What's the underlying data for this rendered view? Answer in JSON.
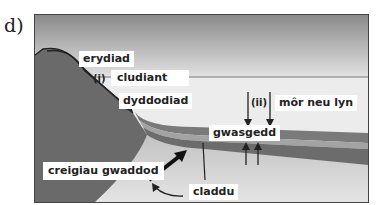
{
  "figure": {
    "part_label": "d)"
  },
  "labels": {
    "erosion": "erydiad",
    "step_i": "(i)",
    "transport": "cludiant",
    "deposition": "dyddodiad",
    "step_ii": "(ii)",
    "sea_or_lake": "môr neu lyn",
    "compaction": "gwasgedd",
    "sedimentary_rocks": "creigiau gwaddod",
    "burial": "claddu"
  },
  "colors": {
    "sky_top": "#8a8a8a",
    "sky_bottom": "#e6e6e6",
    "water": "#ededed",
    "land": "#707070",
    "layer_dark": "#6e6e6e",
    "layer_mid": "#9a9a9a",
    "seabed": "#cfcfcf"
  }
}
